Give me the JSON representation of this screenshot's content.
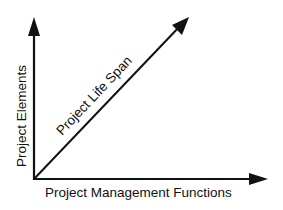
{
  "diagram": {
    "type": "three-axis concept diagram",
    "axes": {
      "vertical": {
        "label": "Project Elements"
      },
      "horizontal": {
        "label": "Project Management Functions"
      },
      "diagonal": {
        "label": "Project Life Span"
      }
    },
    "colors": {
      "line": "#111111",
      "background": "#ffffff"
    }
  }
}
